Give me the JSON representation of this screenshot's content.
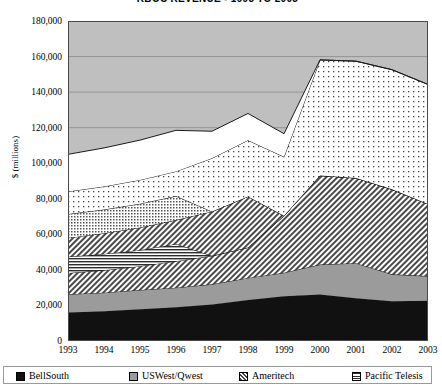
{
  "chart_data": {
    "type": "area",
    "stacked": true,
    "title": "RBOC REVENUE - 1993 TO 2003",
    "xlabel": "",
    "ylabel": "$ (millions)",
    "categories": [
      "1993",
      "1994",
      "1995",
      "1996",
      "1997",
      "1998",
      "1999",
      "2000",
      "2001",
      "2002",
      "2003"
    ],
    "ylim": [
      0,
      180000
    ],
    "ytick_labels": [
      "0",
      "20,000",
      "40,000",
      "60,000",
      "80,000",
      "100,000",
      "120,000",
      "140,000",
      "160,000",
      "180,000"
    ],
    "ytick_values": [
      0,
      20000,
      40000,
      60000,
      80000,
      100000,
      120000,
      140000,
      160000,
      180000
    ],
    "grid": true,
    "legend_position": "bottom",
    "series": [
      {
        "name": "BellSouth",
        "fill": "solid-black",
        "color": "#111111",
        "values": [
          16000,
          16800,
          17900,
          19000,
          20600,
          23100,
          25200,
          26200,
          24100,
          22400,
          22600
        ]
      },
      {
        "name": "USWest/Qwest",
        "fill": "solid-gray",
        "color": "#9b9b9b",
        "values": [
          10300,
          10400,
          10800,
          11000,
          11300,
          12400,
          13200,
          16800,
          19700,
          15100,
          13900
        ]
      },
      {
        "name": "Ameritech",
        "fill": "diagonal-hatch",
        "color": "#d8d8d8",
        "values": [
          11900,
          12600,
          13400,
          14900,
          16000,
          17100,
          32000,
          50100,
          47900,
          47800,
          40600
        ]
      },
      {
        "name": "Pacific Telesis",
        "fill": "horizontal-lines",
        "color": "#cccccc",
        "values": [
          9200,
          9200,
          9000,
          9700,
          0,
          0,
          0,
          0,
          0,
          0,
          0
        ]
      },
      {
        "name": "SBC",
        "fill": "diagonal-hatch-2",
        "color": "#dcdcdc",
        "values": [
          10600,
          11600,
          12700,
          13400,
          24900,
          28700,
          0,
          0,
          0,
          0,
          0
        ]
      },
      {
        "name": "NYNEX",
        "fill": "fine-dots",
        "color": "#e8e8e8",
        "values": [
          13400,
          13300,
          13400,
          13500,
          0,
          0,
          0,
          0,
          0,
          0,
          0
        ]
      },
      {
        "name": "Bell Atlantic",
        "fill": "open-dots",
        "color": "#f4f4f4",
        "values": [
          12700,
          13000,
          13400,
          13900,
          30000,
          31600,
          33200,
          65000,
          65700,
          67300,
          67200
        ]
      },
      {
        "name": "Other",
        "fill": "white",
        "color": "#ffffff",
        "values": [
          20900,
          21700,
          22400,
          23100,
          15200,
          15100,
          13000,
          0,
          0,
          0,
          0
        ]
      }
    ],
    "stack_totals": [
      105000,
      108600,
      113000,
      118500,
      118000,
      128000,
      116600,
      158100,
      157400,
      152600,
      144300
    ]
  },
  "legend": {
    "items": [
      {
        "label": "BellSouth",
        "swatch": "solid-black"
      },
      {
        "label": "USWest/Qwest",
        "swatch": "solid-gray"
      },
      {
        "label": "Ameritech",
        "swatch": "diagonal-hatch"
      },
      {
        "label": "Pacific Telesis",
        "swatch": "horizontal-lines"
      }
    ]
  }
}
